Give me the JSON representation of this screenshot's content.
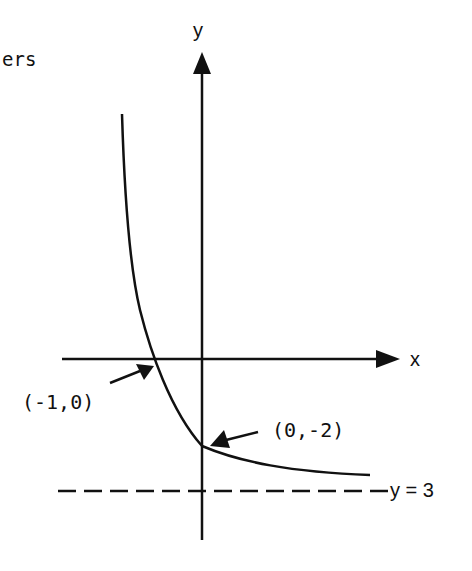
{
  "header_fragment": "ers",
  "diagram": {
    "type": "function-graph",
    "axes": {
      "x_label": "x",
      "y_label": "y"
    },
    "points": [
      {
        "label": "(-1,0)",
        "x": -1,
        "y": 0
      },
      {
        "label": "(0,-2)",
        "x": 0,
        "y": -2
      }
    ],
    "asymptote": {
      "label": "y = 3",
      "style": "dashed"
    },
    "colors": {
      "ink": "#111111",
      "background": "#ffffff"
    }
  }
}
